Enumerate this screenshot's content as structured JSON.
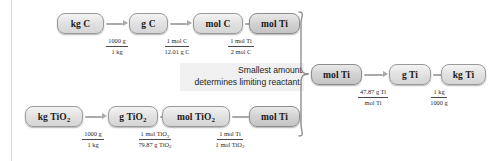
{
  "diagram": {
    "note": {
      "line1": "Smallest amount",
      "line2": "determines limiting reactant."
    },
    "colors": {
      "box_fill": "#e2e2e2",
      "box_fill_dark": "#d3d3d3",
      "box_border": "#9a9a9a",
      "arrow": "#a9a9a9",
      "text": "#1b1b1b",
      "note_background": "#f0f0f0"
    },
    "top_chain": {
      "nodes": [
        {
          "label": "kg C"
        },
        {
          "label": "g C"
        },
        {
          "label": "mol C"
        },
        {
          "label": "mol Ti",
          "highlight": true
        }
      ],
      "factors": [
        {
          "numerator": "1000 g",
          "denominator": "1 kg"
        },
        {
          "numerator": "1 mol C",
          "denominator": "12.01 g C"
        },
        {
          "numerator": "1 mol Ti",
          "denominator": "2 mol C"
        }
      ]
    },
    "bottom_chain": {
      "nodes": [
        {
          "label": "kg TiO",
          "sub": "2"
        },
        {
          "label": "g TiO",
          "sub": "2"
        },
        {
          "label": "mol TiO",
          "sub": "2"
        },
        {
          "label": "mol Ti",
          "highlight": true
        }
      ],
      "factors": [
        {
          "numerator": "1000 g",
          "denominator": "1 kg"
        },
        {
          "numerator": "1 mol TiO",
          "numerator_sub": "2",
          "denominator": "79.87 g TiO",
          "denominator_sub": "2"
        },
        {
          "numerator": "1 mol Ti",
          "denominator": "1 mol TiO",
          "denominator_sub": "2"
        }
      ]
    },
    "result_chain": {
      "nodes": [
        {
          "label": "mol Ti",
          "highlight": true
        },
        {
          "label": "g Ti"
        },
        {
          "label": "kg Ti"
        }
      ],
      "factors": [
        {
          "numerator": "47.87 g Ti",
          "denominator": "mol Ti"
        },
        {
          "numerator": "1 kg",
          "denominator": "1000 g"
        }
      ]
    }
  }
}
